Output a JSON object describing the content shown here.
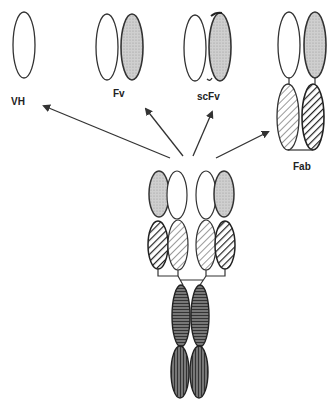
{
  "diagram": {
    "type": "antibody-fragments",
    "labels": {
      "vh": "VH",
      "fv": "Fv",
      "scfv": "scFv",
      "fab": "Fab"
    },
    "colors": {
      "stroke": "#333333",
      "variable_heavy_fill": "#c8c8c8",
      "light_fill": "#ffffff",
      "hatch_light": "#555555",
      "hatch_dark": "#222222",
      "constant_fill": "#666666"
    },
    "fragments": [
      {
        "name": "VH",
        "domains": [
          "white"
        ]
      },
      {
        "name": "Fv",
        "domains": [
          "white",
          "gray"
        ]
      },
      {
        "name": "scFv",
        "domains": [
          "white",
          "gray (linked)"
        ]
      },
      {
        "name": "Fab",
        "domains": [
          "white",
          "gray",
          "light-hatched",
          "dark-hatched"
        ]
      }
    ],
    "source": "whole antibody (IgG) at bottom center with arrows to each fragment"
  }
}
